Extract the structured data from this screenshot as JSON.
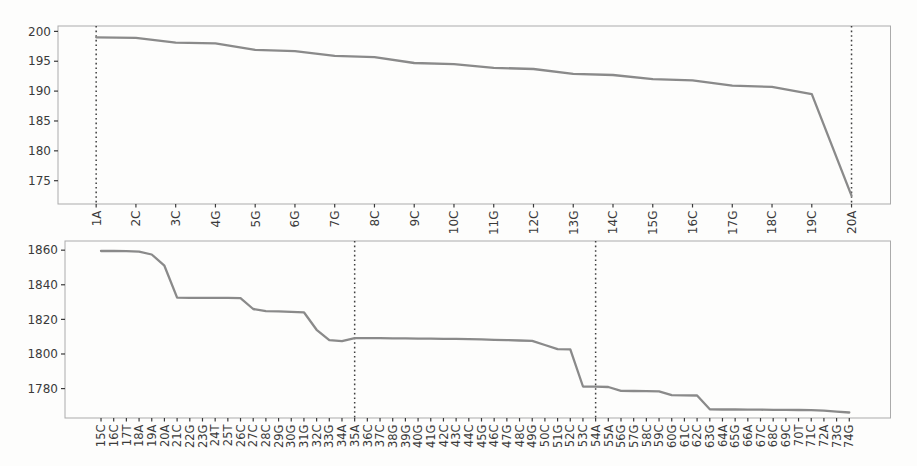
{
  "style": {
    "background": "#fdfdfc",
    "line_color": "#8a8a8a",
    "vline_color": "#3f3f3f",
    "frame_color": "#ababab",
    "tick_color": "#3a3a3a",
    "text_color": "#3a3a3a"
  },
  "chart_data": [
    {
      "id": "top-chart",
      "type": "line",
      "categories": [
        "1A",
        "2C",
        "3C",
        "4G",
        "5G",
        "6G",
        "7G",
        "8C",
        "9C",
        "10C",
        "11G",
        "12C",
        "13G",
        "14C",
        "15G",
        "16C",
        "17G",
        "18C",
        "19C",
        "20A"
      ],
      "values": [
        199.0,
        198.9,
        198.1,
        198.0,
        196.9,
        196.7,
        195.9,
        195.7,
        194.7,
        194.5,
        193.9,
        193.7,
        192.9,
        192.7,
        192.0,
        191.8,
        190.9,
        190.7,
        189.5,
        172.5
      ],
      "yticks": [
        175,
        180,
        185,
        190,
        195,
        200
      ],
      "ylim": [
        171.1,
        200.9
      ],
      "vlines": [
        "1A",
        "20A"
      ],
      "grid": false,
      "legend": null
    },
    {
      "id": "bottom-chart",
      "type": "line",
      "categories": [
        "15C",
        "16C",
        "17T",
        "18A",
        "19A",
        "20A",
        "21C",
        "22G",
        "23G",
        "24T",
        "25T",
        "26C",
        "27C",
        "28C",
        "29G",
        "30G",
        "31G",
        "32C",
        "33G",
        "34A",
        "35A",
        "36C",
        "37C",
        "38G",
        "39G",
        "40G",
        "41G",
        "42C",
        "43C",
        "44C",
        "45G",
        "46C",
        "47G",
        "48C",
        "49G",
        "50C",
        "51G",
        "52C",
        "53C",
        "54A",
        "55A",
        "56G",
        "57G",
        "58C",
        "59C",
        "60G",
        "61C",
        "62C",
        "63G",
        "64A",
        "65G",
        "66A",
        "67C",
        "68C",
        "69C",
        "70T",
        "71C",
        "72A",
        "73G",
        "74G"
      ],
      "values": [
        1859.5,
        1859.5,
        1859.4,
        1859.2,
        1857.5,
        1851.0,
        1832.6,
        1832.5,
        1832.5,
        1832.4,
        1832.4,
        1832.3,
        1826.0,
        1824.7,
        1824.6,
        1824.3,
        1824.1,
        1814.0,
        1808.0,
        1807.4,
        1809.2,
        1809.1,
        1809.1,
        1809.0,
        1809.0,
        1808.9,
        1808.9,
        1808.8,
        1808.7,
        1808.6,
        1808.4,
        1808.2,
        1808.0,
        1807.8,
        1807.6,
        1805.2,
        1802.8,
        1802.7,
        1781.2,
        1781.1,
        1780.9,
        1778.7,
        1778.6,
        1778.5,
        1778.4,
        1776.2,
        1776.1,
        1776.0,
        1768.0,
        1767.9,
        1767.9,
        1767.8,
        1767.8,
        1767.7,
        1767.7,
        1767.6,
        1767.5,
        1767.2,
        1766.7,
        1766.2
      ],
      "yticks": [
        1780,
        1800,
        1820,
        1840,
        1860
      ],
      "ylim": [
        1763.0,
        1865.3
      ],
      "vlines": [
        "35A",
        "54A"
      ],
      "grid": false,
      "legend": null
    }
  ]
}
